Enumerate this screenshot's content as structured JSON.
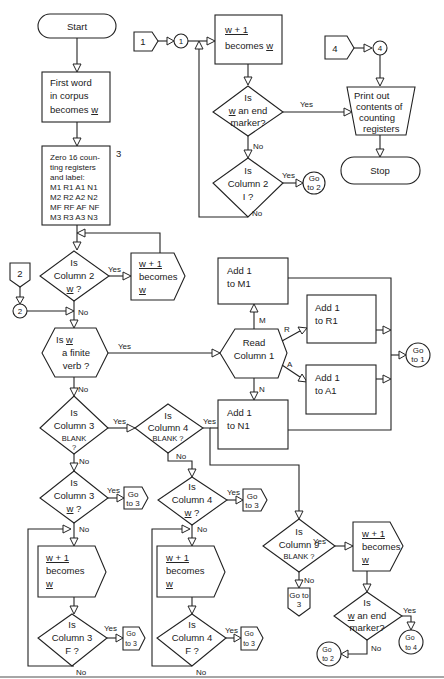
{
  "diagram": {
    "start": "Start",
    "stop": "Stop",
    "first_word": [
      "First word",
      "in corpus",
      "becomes w"
    ],
    "zero_registers": {
      "step_number": "3",
      "lines": [
        "Zero 16 coun-",
        "ting registers",
        "and label:",
        "M1 R1 A1 N1",
        "M2 R2 A2 N2",
        "MF RF AF NF",
        "M3 R3 A3 N3"
      ]
    },
    "connector_1": {
      "offpage": "1",
      "onpage": "1"
    },
    "connector_2": {
      "offpage": "2",
      "onpage": "2"
    },
    "connector_4": {
      "offpage": "4",
      "onpage": "4"
    },
    "loop1_next": [
      "w + 1",
      "becomes w"
    ],
    "end_marker_q": [
      "Is",
      "w an end",
      "marker?"
    ],
    "col2_I_q": [
      "Is",
      "Column 2",
      "I ?"
    ],
    "goto2_top": [
      "Go",
      "to 2"
    ],
    "print_out": [
      "Print  out",
      "contents of",
      "counting",
      "registers"
    ],
    "col2_w_q": [
      "Is",
      "Column 2",
      "w ?"
    ],
    "col2_next": [
      "w + 1",
      "becomes",
      "w"
    ],
    "finite_verb_q": [
      "Is w",
      "a finite",
      "verb ?"
    ],
    "read_col1": [
      "Read",
      "Column 1"
    ],
    "add_m1": [
      "Add  1",
      "to M1"
    ],
    "add_r1": [
      "Add  1",
      "to R1"
    ],
    "add_a1": [
      "Add  1",
      "to A1"
    ],
    "add_n1": [
      "Add  1",
      "to N1"
    ],
    "goto1": [
      "Go",
      "to 1"
    ],
    "branch_labels": {
      "M": "M",
      "R": "R",
      "A": "A",
      "N": "N"
    },
    "col3_blank_q": [
      "Is",
      "Column 3",
      "BLANK",
      "?"
    ],
    "col4_blank_q": [
      "Is",
      "Column 4",
      "BLANK ?"
    ],
    "col3_w_q": [
      "Is",
      "Column 3",
      "w ?"
    ],
    "col4_w_q": [
      "Is",
      "Column 4",
      "w ?"
    ],
    "col3_next": [
      "w + 1",
      "becomes",
      "w"
    ],
    "col4_next": [
      "w + 1",
      "becomes",
      "w"
    ],
    "col3_F_q": [
      "Is",
      "Column 3",
      "F ?"
    ],
    "col4_F_q": [
      "Is",
      "Column 4",
      "F ?"
    ],
    "col9_blank_q": [
      "Is",
      "Column 9",
      "BLANK ?"
    ],
    "col9_next": [
      "w + 1",
      "becomes",
      "w"
    ],
    "end_marker_q2": [
      "Is",
      "w an end",
      "marker?"
    ],
    "goto3": [
      "Go",
      "to 3"
    ],
    "goto3_col9": [
      "Go to",
      "3"
    ],
    "goto2_bottom": [
      "Go",
      "to 2"
    ],
    "goto4": [
      "Go",
      "to 4"
    ],
    "yes": "Yes",
    "no": "No"
  }
}
